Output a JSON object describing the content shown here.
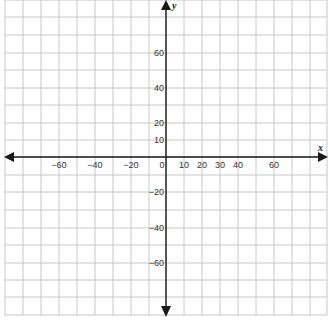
{
  "diagram": {
    "type": "coordinate-plane",
    "x_axis_label": "x",
    "y_axis_label": "y",
    "grid_color": "#c8c8c8",
    "axis_color": "#1a1a1a",
    "x_tick_labels": [
      {
        "value": -60,
        "text": "−60",
        "px": 59
      },
      {
        "value": -40,
        "text": "−40",
        "px": 95
      },
      {
        "value": -20,
        "text": "−20",
        "px": 131
      },
      {
        "value": 0,
        "text": "0",
        "px": 162
      },
      {
        "value": 10,
        "text": "10",
        "px": 184
      },
      {
        "value": 20,
        "text": "20",
        "px": 202
      },
      {
        "value": 30,
        "text": "30",
        "px": 220
      },
      {
        "value": 40,
        "text": "40",
        "px": 238
      },
      {
        "value": 60,
        "text": "60",
        "px": 274
      }
    ],
    "y_tick_labels": [
      {
        "value": 60,
        "text": "60",
        "py": 53
      },
      {
        "value": 40,
        "text": "40",
        "py": 88
      },
      {
        "value": 20,
        "text": "20",
        "py": 123
      },
      {
        "value": 10,
        "text": "10",
        "py": 140
      },
      {
        "value": -20,
        "text": "−20",
        "py": 192
      },
      {
        "value": -40,
        "text": "−40",
        "py": 228
      },
      {
        "value": -60,
        "text": "−60",
        "py": 263
      }
    ],
    "vertical_grid_px": [
      5,
      23,
      41,
      59,
      77,
      95,
      113,
      131,
      149,
      166,
      184,
      202,
      220,
      238,
      256,
      274,
      292,
      310,
      327
    ],
    "horizontal_grid_px": [
      0,
      17,
      35,
      53,
      70,
      88,
      105,
      123,
      140,
      157,
      175,
      192,
      210,
      228,
      245,
      263,
      280,
      297,
      315
    ],
    "origin_px": {
      "x": 166,
      "y": 157
    }
  }
}
